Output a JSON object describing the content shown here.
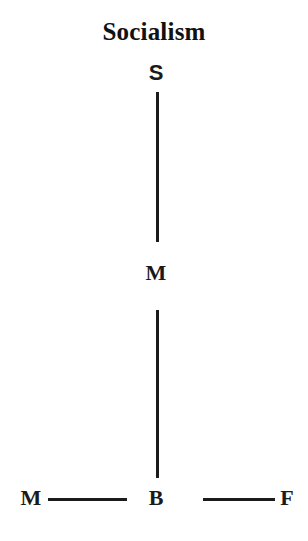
{
  "figure": {
    "title": "Socialism",
    "type": "tree-diagram",
    "background_color": "#ffffff",
    "ink_color": "#1b1b1b"
  },
  "nodes": {
    "top": {
      "label": "S",
      "name": "node-s"
    },
    "middle": {
      "label": "M",
      "name": "node-m-middle"
    },
    "bottom_center": {
      "label": "B",
      "name": "node-b"
    },
    "bottom_left": {
      "label": "M",
      "name": "node-m-left"
    },
    "bottom_right": {
      "label": "F",
      "name": "node-f"
    }
  },
  "edges": [
    {
      "from": "S",
      "to": "M",
      "orientation": "vertical"
    },
    {
      "from": "M",
      "to": "B",
      "orientation": "vertical"
    },
    {
      "from": "M",
      "to": "B",
      "orientation": "horizontal"
    },
    {
      "from": "B",
      "to": "F",
      "orientation": "horizontal"
    }
  ]
}
